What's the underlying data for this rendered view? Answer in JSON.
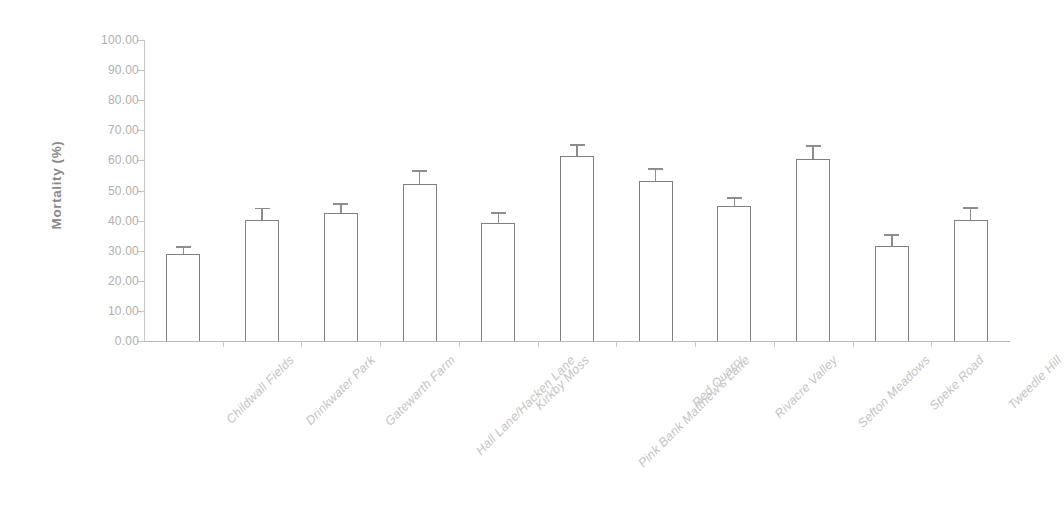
{
  "chart_data": {
    "type": "bar",
    "title": "",
    "subtitle": "",
    "xlabel": "",
    "ylabel": "Mortality (%)",
    "ylim": [
      0,
      100
    ],
    "ytick_values": [
      0,
      10,
      20,
      30,
      40,
      50,
      60,
      70,
      80,
      90,
      100
    ],
    "ytick_labels": [
      "0.00",
      "10.00",
      "20.00",
      "30.00",
      "40.00",
      "50.00",
      "60.00",
      "70.00",
      "80.00",
      "90.00",
      "100.00"
    ],
    "grid": false,
    "legend": null,
    "legend_position": "none",
    "bar_style": {
      "fill": "#ffffff",
      "edge_color": "#808080",
      "error_bar_color": "#8d8d8d",
      "error_bars": "upper-only"
    },
    "categories": [
      "Childwall Fields",
      "Drinkwater Park",
      "Gatewarth Farm",
      "Hall Lane/Hacken Lane",
      "Kirkby Moss",
      "Pink Bank Matthew's Lane",
      "Red Quarry",
      "Rivacre Valley",
      "Sefton Meadows",
      "Speke Road",
      "Tweedle Hill"
    ],
    "values": [
      29.0,
      40.2,
      42.5,
      52.0,
      39.2,
      61.5,
      53.0,
      45.0,
      60.5,
      31.5,
      40.3
    ],
    "errors": [
      2.0,
      3.5,
      2.7,
      4.3,
      3.0,
      3.3,
      3.8,
      2.3,
      4.0,
      3.3,
      3.7
    ],
    "series": [
      {
        "name": "Mortality",
        "values": [
          29.0,
          40.2,
          42.5,
          52.0,
          39.2,
          61.5,
          53.0,
          45.0,
          60.5,
          31.5,
          40.3
        ],
        "errors": [
          2.0,
          3.5,
          2.7,
          4.3,
          3.0,
          3.3,
          3.8,
          2.3,
          4.0,
          3.3,
          3.7
        ]
      }
    ]
  }
}
